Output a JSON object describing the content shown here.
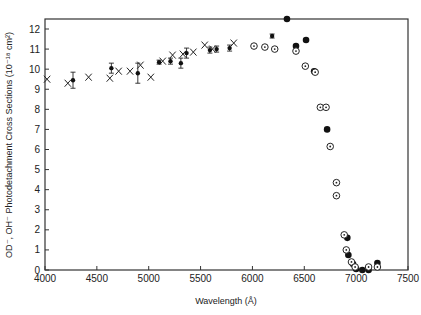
{
  "chart_data": {
    "type": "scatter",
    "title": "",
    "xlabel": "Wavelength (Å)",
    "ylabel": "OD⁻, OH⁻ Photodetachment Cross Sections (10⁻¹⁸ cm²)",
    "xlim": [
      4000,
      7500
    ],
    "ylim": [
      0,
      12.5
    ],
    "grid": false,
    "legend": "none",
    "x_ticks": [
      "4000",
      "4500",
      "5000",
      "5500",
      "6000",
      "6500",
      "7000",
      "7500"
    ],
    "x_tick_values": [
      4000,
      4500,
      5000,
      5500,
      6000,
      6500,
      7000,
      7500
    ],
    "y_ticks": [
      "0",
      "1",
      "2",
      "3",
      "4",
      "5",
      "6",
      "7",
      "8",
      "9",
      "10",
      "11",
      "12"
    ],
    "y_tick_values": [
      0,
      1,
      2,
      3,
      4,
      5,
      6,
      7,
      8,
      9,
      10,
      11,
      12
    ],
    "series": [
      {
        "name": "x-markers",
        "marker": "x",
        "points": [
          {
            "x": 4020,
            "y": 9.5
          },
          {
            "x": 4220,
            "y": 9.3
          },
          {
            "x": 4420,
            "y": 9.6
          },
          {
            "x": 4625,
            "y": 9.55
          },
          {
            "x": 4710,
            "y": 9.9
          },
          {
            "x": 4820,
            "y": 9.9
          },
          {
            "x": 4920,
            "y": 10.2
          },
          {
            "x": 5020,
            "y": 9.6
          },
          {
            "x": 5135,
            "y": 10.4
          },
          {
            "x": 5230,
            "y": 10.7
          },
          {
            "x": 5330,
            "y": 10.75
          },
          {
            "x": 5430,
            "y": 10.85
          },
          {
            "x": 5540,
            "y": 11.2
          },
          {
            "x": 5615,
            "y": 11.0
          },
          {
            "x": 5820,
            "y": 11.3
          }
        ]
      },
      {
        "name": "filled-with-error",
        "marker": "filled-circle",
        "points": [
          {
            "x": 4270,
            "y": 9.45,
            "err": 0.4
          },
          {
            "x": 4640,
            "y": 10.05,
            "err": 0.25
          },
          {
            "x": 4895,
            "y": 9.8,
            "err": 0.5
          },
          {
            "x": 5100,
            "y": 10.35,
            "err": 0.1
          },
          {
            "x": 5210,
            "y": 10.4,
            "err": 0.15
          },
          {
            "x": 5310,
            "y": 10.3,
            "err": 0.25
          },
          {
            "x": 5365,
            "y": 10.8,
            "err": 0.25
          },
          {
            "x": 5590,
            "y": 10.95,
            "err": 0.15
          },
          {
            "x": 5655,
            "y": 11.0,
            "err": 0.15
          },
          {
            "x": 5780,
            "y": 11.05,
            "err": 0.15
          },
          {
            "x": 6190,
            "y": 11.65,
            "err": 0.1
          }
        ]
      },
      {
        "name": "filled",
        "marker": "filled-circle-large",
        "points": [
          {
            "x": 6333,
            "y": 12.5
          },
          {
            "x": 6420,
            "y": 11.15
          },
          {
            "x": 6517,
            "y": 11.45
          },
          {
            "x": 6595,
            "y": 9.9
          },
          {
            "x": 6720,
            "y": 7.0
          },
          {
            "x": 6915,
            "y": 1.6
          },
          {
            "x": 6925,
            "y": 0.75
          },
          {
            "x": 6970,
            "y": 0.3
          },
          {
            "x": 7000,
            "y": 0.05
          },
          {
            "x": 7060,
            "y": 0.0
          },
          {
            "x": 7120,
            "y": 0.0
          },
          {
            "x": 7205,
            "y": 0.35
          }
        ]
      },
      {
        "name": "circled-dot",
        "marker": "circled-dot",
        "points": [
          {
            "x": 6015,
            "y": 11.15
          },
          {
            "x": 6120,
            "y": 11.1
          },
          {
            "x": 6215,
            "y": 11.0
          },
          {
            "x": 6420,
            "y": 10.9
          },
          {
            "x": 6510,
            "y": 10.15
          },
          {
            "x": 6605,
            "y": 9.85
          },
          {
            "x": 6655,
            "y": 8.1
          },
          {
            "x": 6710,
            "y": 8.1
          },
          {
            "x": 6750,
            "y": 6.15
          },
          {
            "x": 6810,
            "y": 4.35
          },
          {
            "x": 6810,
            "y": 3.7
          },
          {
            "x": 6885,
            "y": 1.75
          },
          {
            "x": 6905,
            "y": 1.0
          },
          {
            "x": 6955,
            "y": 0.4
          },
          {
            "x": 6990,
            "y": 0.15
          },
          {
            "x": 7120,
            "y": 0.15
          },
          {
            "x": 7205,
            "y": 0.15
          }
        ]
      }
    ]
  }
}
